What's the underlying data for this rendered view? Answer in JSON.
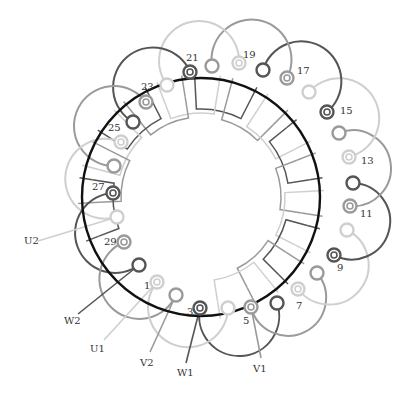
{
  "diagram": {
    "title": "",
    "stator_circle": {
      "cx": 201,
      "cy": 197,
      "r": 119,
      "color": "#111111"
    },
    "phase_colors": {
      "dark": "#555555",
      "mid": "#9a9a9a",
      "light": "#cfcfcf"
    },
    "pins": [
      {
        "id": "1",
        "x": 157,
        "y": 282,
        "type": "ring",
        "phase": "light",
        "label": "1",
        "lx": 144,
        "ly": 289
      },
      {
        "id": "p2",
        "x": 176,
        "y": 295,
        "type": "plain",
        "phase": "mid"
      },
      {
        "id": "3",
        "x": 200,
        "y": 308,
        "type": "ring",
        "phase": "dark",
        "label": "3",
        "lx": 187,
        "ly": 315
      },
      {
        "id": "p4",
        "x": 228,
        "y": 308,
        "type": "plain",
        "phase": "light"
      },
      {
        "id": "5",
        "x": 251,
        "y": 307,
        "type": "ring",
        "phase": "mid",
        "label": "5",
        "lx": 243,
        "ly": 324
      },
      {
        "id": "p6",
        "x": 277,
        "y": 303,
        "type": "plain",
        "phase": "dark"
      },
      {
        "id": "7",
        "x": 298,
        "y": 289,
        "type": "ring",
        "phase": "light",
        "label": "7",
        "lx": 296,
        "ly": 309
      },
      {
        "id": "p8",
        "x": 317,
        "y": 273,
        "type": "plain",
        "phase": "mid"
      },
      {
        "id": "9",
        "x": 334,
        "y": 255,
        "type": "ring",
        "phase": "dark",
        "label": "9",
        "lx": 337,
        "ly": 271
      },
      {
        "id": "p10",
        "x": 347,
        "y": 230,
        "type": "plain",
        "phase": "light"
      },
      {
        "id": "11",
        "x": 350,
        "y": 206,
        "type": "ring",
        "phase": "mid",
        "label": "11",
        "lx": 360,
        "ly": 217
      },
      {
        "id": "p12",
        "x": 353,
        "y": 183,
        "type": "plain",
        "phase": "dark"
      },
      {
        "id": "13",
        "x": 349,
        "y": 157,
        "type": "ring",
        "phase": "light",
        "label": "13",
        "lx": 361,
        "ly": 164
      },
      {
        "id": "p14",
        "x": 339,
        "y": 133,
        "type": "plain",
        "phase": "mid"
      },
      {
        "id": "15",
        "x": 327,
        "y": 112,
        "type": "ring",
        "phase": "dark",
        "label": "15",
        "lx": 340,
        "ly": 114
      },
      {
        "id": "p16",
        "x": 309,
        "y": 92,
        "type": "plain",
        "phase": "light"
      },
      {
        "id": "17",
        "x": 287,
        "y": 78,
        "type": "ring",
        "phase": "mid",
        "label": "17",
        "lx": 297,
        "ly": 74
      },
      {
        "id": "p18",
        "x": 263,
        "y": 70,
        "type": "plain",
        "phase": "dark"
      },
      {
        "id": "19",
        "x": 239,
        "y": 63,
        "type": "ring",
        "phase": "light",
        "label": "19",
        "lx": 243,
        "ly": 58
      },
      {
        "id": "p20",
        "x": 212,
        "y": 66,
        "type": "plain",
        "phase": "mid"
      },
      {
        "id": "21",
        "x": 190,
        "y": 72,
        "type": "ring",
        "phase": "dark",
        "label": "21",
        "lx": 186,
        "ly": 61
      },
      {
        "id": "p22",
        "x": 167,
        "y": 85,
        "type": "plain",
        "phase": "light"
      },
      {
        "id": "23",
        "x": 146,
        "y": 102,
        "type": "ring",
        "phase": "mid",
        "label": "23",
        "lx": 141,
        "ly": 90
      },
      {
        "id": "p24",
        "x": 133,
        "y": 122,
        "type": "plain",
        "phase": "dark"
      },
      {
        "id": "25",
        "x": 121,
        "y": 142,
        "type": "ring",
        "phase": "light",
        "label": "25",
        "lx": 108,
        "ly": 131
      },
      {
        "id": "p26",
        "x": 114,
        "y": 166,
        "type": "plain",
        "phase": "mid"
      },
      {
        "id": "27",
        "x": 113,
        "y": 193,
        "type": "ring",
        "phase": "dark",
        "label": "27",
        "lx": 92,
        "ly": 190
      },
      {
        "id": "p28",
        "x": 117,
        "y": 217,
        "type": "plain",
        "phase": "light"
      },
      {
        "id": "29",
        "x": 124,
        "y": 242,
        "type": "ring",
        "phase": "mid",
        "label": "29",
        "lx": 104,
        "ly": 245
      },
      {
        "id": "p30",
        "x": 139,
        "y": 265,
        "type": "plain",
        "phase": "dark"
      }
    ],
    "end_loops": [
      {
        "from": "3",
        "to": "p6",
        "phase": "dark",
        "sweep": 0,
        "r": 40
      },
      {
        "from": "5",
        "to": "p8",
        "phase": "mid",
        "sweep": 0,
        "r": 36
      },
      {
        "from": "7",
        "to": "p10",
        "phase": "light",
        "sweep": 0,
        "r": 38
      },
      {
        "from": "9",
        "to": "p12",
        "phase": "dark",
        "sweep": 0,
        "r": 37
      },
      {
        "from": "11",
        "to": "p14",
        "phase": "mid",
        "sweep": 0,
        "r": 37
      },
      {
        "from": "13",
        "to": "p16",
        "phase": "light",
        "sweep": 0,
        "r": 40
      },
      {
        "from": "15",
        "to": "p18",
        "phase": "dark",
        "sweep": 0,
        "r": 40
      },
      {
        "from": "17",
        "to": "p20",
        "phase": "mid",
        "sweep": 0,
        "r": 40
      },
      {
        "from": "19",
        "to": "p22",
        "phase": "light",
        "sweep": 0,
        "r": 40
      },
      {
        "from": "21",
        "to": "p24",
        "phase": "dark",
        "sweep": 0,
        "r": 40
      },
      {
        "from": "23",
        "to": "p26",
        "phase": "mid",
        "sweep": 0,
        "r": 40
      },
      {
        "from": "25",
        "to": "p28",
        "phase": "light",
        "sweep": 0,
        "r": 40
      },
      {
        "from": "27",
        "to": "p30",
        "phase": "dark",
        "sweep": 0,
        "r": 40
      },
      {
        "from": "29",
        "to": "p2",
        "phase": "mid",
        "sweep": 0,
        "r": 40
      },
      {
        "from": "1",
        "to": "p4",
        "phase": "light",
        "sweep": 0,
        "r": 40
      }
    ],
    "terminals": [
      {
        "label": "U2",
        "x": 24,
        "y": 244,
        "to": "p28",
        "phase": "light",
        "tx": 38,
        "ty": 241
      },
      {
        "label": "W2",
        "x": 64,
        "y": 324,
        "to": "p30",
        "phase": "dark",
        "tx": 78,
        "ty": 314
      },
      {
        "label": "U1",
        "x": 90,
        "y": 352,
        "to": "1",
        "phase": "light",
        "tx": 104,
        "ty": 340
      },
      {
        "label": "V2",
        "x": 140,
        "y": 366,
        "to": "p2",
        "phase": "mid",
        "tx": 150,
        "ty": 352
      },
      {
        "label": "W1",
        "x": 177,
        "y": 376,
        "to": "3",
        "phase": "dark",
        "tx": 186,
        "ty": 363
      },
      {
        "label": "V1",
        "x": 253,
        "y": 372,
        "to": "5",
        "phase": "mid",
        "tx": 261,
        "ty": 358
      }
    ],
    "inner_coils": [
      {
        "a1": 93,
        "a2": 63,
        "phase": "dark",
        "ri": 88,
        "ro": 110
      },
      {
        "a1": 75,
        "a2": 45,
        "phase": "mid",
        "ri": 80,
        "ro": 102
      },
      {
        "a1": 57,
        "a2": 27,
        "phase": "light",
        "ri": 84,
        "ro": 106
      },
      {
        "a1": 39,
        "a2": 9,
        "phase": "dark",
        "ri": 88,
        "ro": 110
      },
      {
        "a1": 21,
        "a2": -9,
        "phase": "mid",
        "ri": 80,
        "ro": 102
      },
      {
        "a1": 3,
        "a2": -27,
        "phase": "light",
        "ri": 84,
        "ro": 106
      },
      {
        "a1": -15,
        "a2": -45,
        "phase": "dark",
        "ri": 88,
        "ro": 110
      },
      {
        "a1": -33,
        "a2": -63,
        "phase": "mid",
        "ri": 80,
        "ro": 102
      },
      {
        "a1": -51,
        "a2": -81,
        "phase": "light",
        "ri": 84,
        "ro": 106
      },
      {
        "a1": 111,
        "a2": 81,
        "phase": "light",
        "ri": 84,
        "ro": 106
      },
      {
        "a1": 129,
        "a2": 99,
        "phase": "mid",
        "ri": 80,
        "ro": 102
      },
      {
        "a1": 147,
        "a2": 117,
        "phase": "dark",
        "ri": 88,
        "ro": 110
      },
      {
        "a1": 165,
        "a2": 135,
        "phase": "light",
        "ri": 84,
        "ro": 106
      },
      {
        "a1": 183,
        "a2": 153,
        "phase": "mid",
        "ri": 80,
        "ro": 102
      },
      {
        "a1": 201,
        "a2": 171,
        "phase": "dark",
        "ri": 88,
        "ro": 110
      }
    ]
  }
}
